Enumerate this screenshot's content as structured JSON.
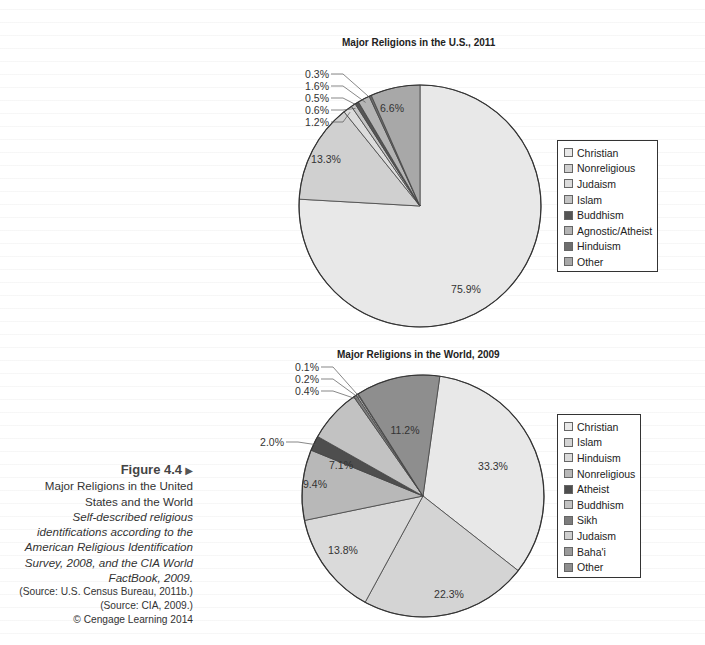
{
  "caption": {
    "figure_label": "Figure 4.4",
    "arrow_icon": "▶",
    "title_lines": [
      "Major Religions in the United",
      "States and the World"
    ],
    "description_lines": [
      "Self-described religious",
      "identifications according to the",
      "American Religious Identification",
      "Survey, 2008, and the CIA World",
      "FactBook, 2009."
    ],
    "sources": [
      "(Source: U.S. Census Bureau, 2011b.)",
      "(Source: CIA, 2009.)"
    ],
    "copyright": "© Cengage Learning 2014"
  },
  "chart_data": [
    {
      "type": "pie",
      "title": "Major Religions in the U.S., 2011",
      "categories": [
        "Christian",
        "Nonreligious",
        "Judaism",
        "Islam",
        "Buddhism",
        "Agnostic/Atheist",
        "Hinduism",
        "Other"
      ],
      "values": [
        75.9,
        13.3,
        1.2,
        0.6,
        0.5,
        1.6,
        0.3,
        6.6
      ],
      "labels": [
        "75.9%",
        "13.3%",
        "1.2%",
        "0.6%",
        "0.5%",
        "1.6%",
        "0.3%",
        "6.6%"
      ],
      "colors": [
        "#e8e8e8",
        "#d0d0d0",
        "#dcdcdc",
        "#c4c4c4",
        "#555555",
        "#b4b4b4",
        "#6e6e6e",
        "#a8a8a8"
      ],
      "start_angle_deg": 0,
      "direction": "clockwise",
      "legend_position": "right"
    },
    {
      "type": "pie",
      "title": "Major Religions in the World, 2009",
      "categories": [
        "Christian",
        "Islam",
        "Hinduism",
        "Nonreligious",
        "Atheist",
        "Buddhism",
        "Sikh",
        "Judaism",
        "Baha'i",
        "Other"
      ],
      "values": [
        33.3,
        22.3,
        13.8,
        9.4,
        2.0,
        7.1,
        0.4,
        0.2,
        0.1,
        11.2
      ],
      "labels": [
        "33.3%",
        "22.3%",
        "13.8%",
        "9.4%",
        "2.0%",
        "7.1%",
        "0.4%",
        "0.2%",
        "0.1%",
        "11.2%"
      ],
      "colors": [
        "#e8e8e8",
        "#d4d4d4",
        "#dadada",
        "#b8b8b8",
        "#4e4e4e",
        "#c2c2c2",
        "#7c7c7c",
        "#cfcfcf",
        "#9a9a9a",
        "#8e8e8e"
      ],
      "start_angle_deg": 8,
      "direction": "clockwise",
      "legend_position": "right"
    }
  ]
}
